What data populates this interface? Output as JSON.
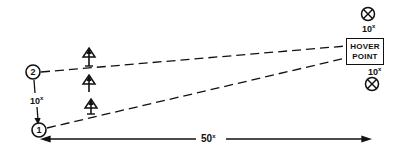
{
  "diagram": {
    "nodes": [
      {
        "id": "2",
        "label": "2",
        "x": 33,
        "y": 72
      },
      {
        "id": "1",
        "label": "1",
        "x": 39,
        "y": 130
      }
    ],
    "hover_point": {
      "line1": "HOVER",
      "line2": "POINT"
    },
    "markers": [
      {
        "icon": "x-circle-icon",
        "label": "10",
        "label_sup": "x",
        "position": "above"
      },
      {
        "icon": "x-circle-icon",
        "label": "10",
        "label_sup": "x",
        "position": "below"
      }
    ],
    "distances": {
      "vertical": {
        "value": "10",
        "unit": "x"
      },
      "horizontal": {
        "value": "50",
        "unit": "x"
      }
    },
    "aircraft_icons": [
      {
        "icon": "arrow-triangle-icon",
        "x": 89,
        "y": 55
      },
      {
        "icon": "arrow-triangle-icon",
        "x": 89,
        "y": 82
      },
      {
        "icon": "arrow-triangle-icon",
        "x": 91,
        "y": 106
      }
    ],
    "colors": {
      "ink": "#111111",
      "background": "#ffffff"
    }
  }
}
